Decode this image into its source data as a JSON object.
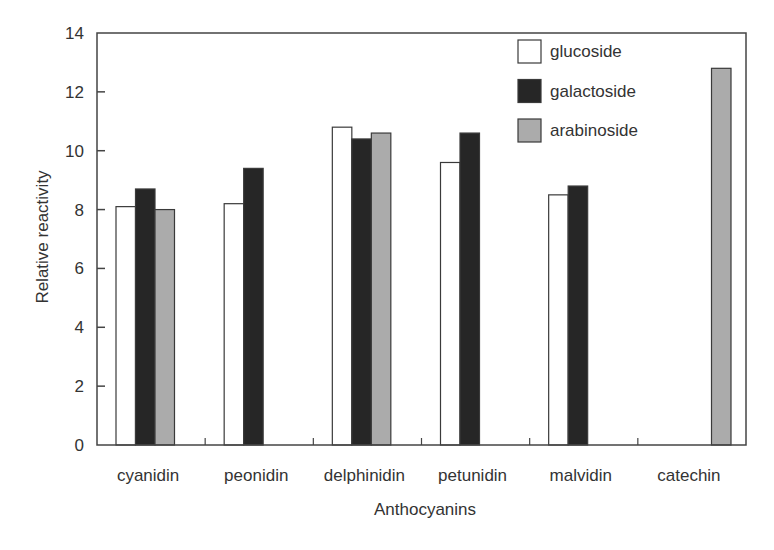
{
  "chart_data": {
    "type": "bar",
    "title": "",
    "xlabel": "Anthocyanins",
    "ylabel": "Relative reactivity",
    "ylim": [
      0,
      14
    ],
    "yticks": [
      0,
      2,
      4,
      6,
      8,
      10,
      12,
      14
    ],
    "grid": false,
    "legend_position": "upper right (inside)",
    "categories": [
      "cyanidin",
      "peonidin",
      "delphinidin",
      "petunidin",
      "malvidin",
      "catechin"
    ],
    "series": [
      {
        "name": "glucoside",
        "color": "#ffffff",
        "values": [
          8.1,
          8.2,
          10.8,
          9.6,
          8.5,
          null
        ]
      },
      {
        "name": "galactoside",
        "color": "#262626",
        "values": [
          8.7,
          9.4,
          10.4,
          10.6,
          8.8,
          null
        ]
      },
      {
        "name": "arabinoside",
        "color": "#ababab",
        "values": [
          8.0,
          null,
          10.6,
          null,
          null,
          12.8
        ]
      }
    ]
  },
  "colors": {
    "axis": "#444444",
    "text": "#333333",
    "bar_outline": "#3a3a3a"
  }
}
